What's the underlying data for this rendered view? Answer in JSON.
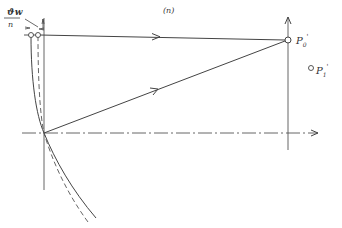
{
  "diagram": {
    "panel_label": "(n)",
    "fraction_label": {
      "numerator": "ϑw",
      "denominator": "n"
    },
    "points": [
      {
        "name": "P0'",
        "label_base": "P",
        "label_sub": "0",
        "label_prime": "'",
        "x": 288,
        "y": 40,
        "style": "open-circle"
      },
      {
        "name": "P1'",
        "label_base": "P",
        "label_sub": "1",
        "label_prime": "'",
        "x": 311,
        "y": 68,
        "style": "open-circle"
      }
    ],
    "colors": {
      "line": "#444444",
      "background": "#ffffff"
    }
  }
}
